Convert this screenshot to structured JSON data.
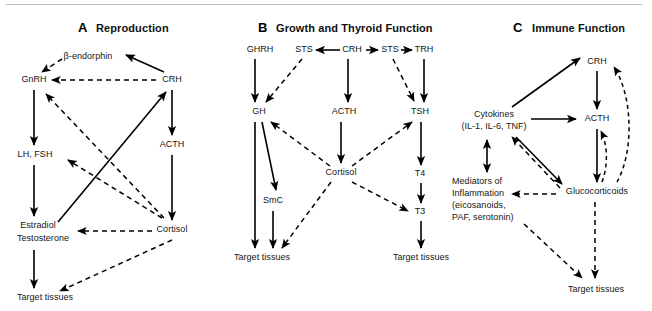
{
  "figure": {
    "width": 652,
    "height": 311,
    "background": "#ffffff",
    "line_color": "#000000",
    "rule_color": "#b8b8b8"
  },
  "panels": [
    {
      "letter": "A",
      "title": "Reproduction",
      "nodes": [
        {
          "id": "a-bendorphin",
          "label": "β-endorphin",
          "x": 88,
          "y": 57
        },
        {
          "id": "a-gnrh",
          "label": "GnRH",
          "x": 34,
          "y": 80
        },
        {
          "id": "a-crh",
          "label": "CRH",
          "x": 172,
          "y": 80
        },
        {
          "id": "a-lhfsh",
          "label": "LH, FSH",
          "x": 35,
          "y": 155
        },
        {
          "id": "a-acth",
          "label": "ACTH",
          "x": 172,
          "y": 145
        },
        {
          "id": "a-estradiol",
          "label": "Estradiol",
          "x": 38,
          "y": 226
        },
        {
          "id": "a-testosterone",
          "label": "Testosterone",
          "x": 43,
          "y": 239
        },
        {
          "id": "a-cortisol",
          "label": "Cortisol",
          "x": 172,
          "y": 230
        },
        {
          "id": "a-target",
          "label": "Target tissues",
          "x": 45,
          "y": 298
        }
      ]
    },
    {
      "letter": "B",
      "title": "Growth and Thyroid Function",
      "nodes": [
        {
          "id": "b-ghrh",
          "label": "GHRH",
          "x": 260,
          "y": 50
        },
        {
          "id": "b-sts1",
          "label": "STS",
          "x": 304,
          "y": 50
        },
        {
          "id": "b-crh",
          "label": "CRH",
          "x": 352,
          "y": 50
        },
        {
          "id": "b-sts2",
          "label": "STS",
          "x": 390,
          "y": 50
        },
        {
          "id": "b-trh",
          "label": "TRH",
          "x": 424,
          "y": 50
        },
        {
          "id": "b-gh",
          "label": "GH",
          "x": 259,
          "y": 112
        },
        {
          "id": "b-acth",
          "label": "ACTH",
          "x": 344,
          "y": 112
        },
        {
          "id": "b-tsh",
          "label": "TSH",
          "x": 420,
          "y": 112
        },
        {
          "id": "b-cortisol",
          "label": "Cortisol",
          "x": 341,
          "y": 173
        },
        {
          "id": "b-smc",
          "label": "SmC",
          "x": 273,
          "y": 201
        },
        {
          "id": "b-t4",
          "label": "T4",
          "x": 420,
          "y": 174
        },
        {
          "id": "b-t3",
          "label": "T3",
          "x": 420,
          "y": 212
        },
        {
          "id": "b-target-left",
          "label": "Target tissues",
          "x": 262,
          "y": 258
        },
        {
          "id": "b-target-right",
          "label": "Target tissues",
          "x": 421,
          "y": 258
        }
      ]
    },
    {
      "letter": "C",
      "title": "Immune Function",
      "nodes": [
        {
          "id": "c-crh",
          "label": "CRH",
          "x": 597,
          "y": 62
        },
        {
          "id": "c-acth",
          "label": "ACTH",
          "x": 597,
          "y": 119
        },
        {
          "id": "c-cytokines-1",
          "label": "Cytokines",
          "x": 494,
          "y": 115
        },
        {
          "id": "c-cytokines-2",
          "label": "(IL-1, IL-6, TNF)",
          "x": 494,
          "y": 127
        },
        {
          "id": "c-mediators-1",
          "label": "Mediators of",
          "x": 464,
          "y": 182
        },
        {
          "id": "c-mediators-2",
          "label": "Inflammation",
          "x": 464,
          "y": 194
        },
        {
          "id": "c-mediators-3",
          "label": "(eicosanoids,",
          "x": 464,
          "y": 206
        },
        {
          "id": "c-mediators-4",
          "label": "PAF, serotonin)",
          "x": 464,
          "y": 218
        },
        {
          "id": "c-glucocorticoids",
          "label": "Glucocorticoids",
          "x": 597,
          "y": 192
        },
        {
          "id": "c-target",
          "label": "Target tissues",
          "x": 596,
          "y": 290
        }
      ]
    }
  ],
  "legend": {
    "solid_meaning": "stimulation",
    "dashed_meaning": "inhibition / feedback"
  }
}
